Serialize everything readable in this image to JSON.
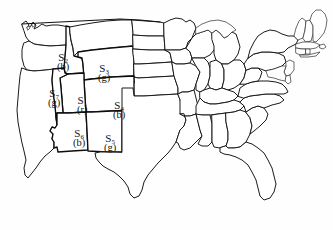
{
  "figure": {
    "name": "united-states-map-diagram",
    "background_color": "#fefefe",
    "outline_color": "#141414"
  },
  "legend_note": {
    "color_codes": [
      "r",
      "g",
      "b"
    ]
  },
  "labeled_states": [
    {
      "id": "s2",
      "symbol": "S",
      "subscript": "2",
      "color_code": "(b)",
      "region": "idaho",
      "x": 57,
      "y": 52
    },
    {
      "id": "s3",
      "symbol": "S",
      "subscript": "3",
      "color_code": "(g)",
      "region": "wyoming",
      "x": 98,
      "y": 63
    },
    {
      "id": "s7",
      "symbol": "S",
      "subscript": "7",
      "color_code": "(g)",
      "region": "nevada",
      "x": 48,
      "y": 88
    },
    {
      "id": "s1",
      "symbol": "S",
      "subscript": "1",
      "color_code": "(r)",
      "region": "utah",
      "x": 77,
      "y": 95
    },
    {
      "id": "s4",
      "symbol": "S",
      "subscript": "4",
      "color_code": "(b)",
      "region": "colorado",
      "x": 113,
      "y": 100
    },
    {
      "id": "s6",
      "symbol": "S",
      "subscript": "6",
      "color_code": "(b)",
      "region": "arizona",
      "x": 73,
      "y": 128
    },
    {
      "id": "s5",
      "symbol": "S",
      "subscript": "5",
      "color_code": "(g)",
      "region": "new-mexico",
      "x": 104,
      "y": 133
    }
  ]
}
